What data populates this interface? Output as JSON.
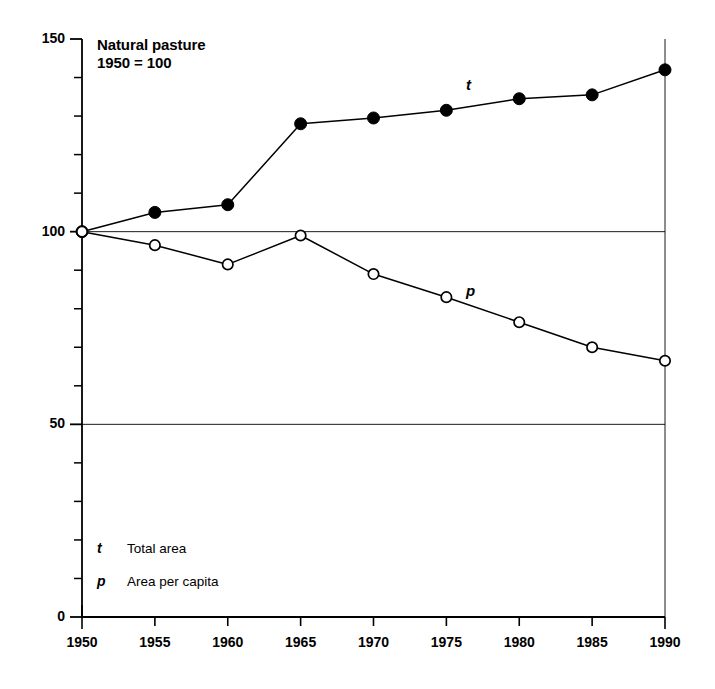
{
  "chart_data": {
    "type": "line",
    "title": "Natural pasture",
    "subtitle": "1950 = 100",
    "xlabel": "",
    "ylabel": "",
    "x": [
      1950,
      1955,
      1960,
      1965,
      1970,
      1975,
      1980,
      1985,
      1990
    ],
    "xticklabels": [
      "1950",
      "1955",
      "1960",
      "1965",
      "1970",
      "1975",
      "1980",
      "1985",
      "1990"
    ],
    "xlim": [
      1950,
      1990
    ],
    "ylim": [
      0,
      150
    ],
    "yticks": [
      0,
      50,
      100,
      150
    ],
    "yticklabels": [
      "0",
      "50",
      "100",
      "150"
    ],
    "y_minor_tick_interval": 10,
    "gridlines": [
      50,
      100
    ],
    "grid": true,
    "legend_position": "inside-lower-left",
    "series": [
      {
        "name": "t",
        "label": "Total area",
        "marker": "filled-circle",
        "color": "#000000",
        "values": [
          100,
          105,
          107,
          128,
          129.5,
          131.5,
          134.5,
          135.5,
          142
        ]
      },
      {
        "name": "p",
        "label": "Area per capita",
        "marker": "open-circle",
        "color": "#000000",
        "values": [
          100,
          96.5,
          91.5,
          99,
          89,
          83,
          76.5,
          70,
          66.5
        ]
      }
    ],
    "annotations": [
      {
        "text": "t",
        "series": "t"
      },
      {
        "text": "p",
        "series": "p"
      }
    ]
  },
  "legend": {
    "rows": [
      {
        "key": "t",
        "label": "Total area"
      },
      {
        "key": "p",
        "label": "Area per capita"
      }
    ]
  }
}
